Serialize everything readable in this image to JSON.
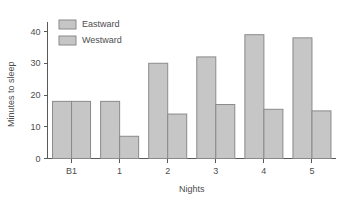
{
  "chart_data": {
    "type": "bar",
    "title": "",
    "subtitle": "",
    "xlabel": "Nights",
    "ylabel": "Minutes to sleep",
    "categories": [
      "B1",
      "1",
      "2",
      "3",
      "4",
      "5"
    ],
    "series": [
      {
        "name": "Eastward",
        "values": [
          18,
          18,
          30,
          32,
          39,
          38
        ],
        "color": "#c6c6c6"
      },
      {
        "name": "Westward",
        "values": [
          18,
          7,
          14,
          17,
          15.5,
          15
        ],
        "color": "#c6c6c6"
      }
    ],
    "ylim": [
      0,
      43
    ],
    "yticks": [
      0,
      10,
      20,
      30,
      40
    ],
    "ytick_labels": [
      "0",
      "10",
      "20",
      "30",
      "40"
    ],
    "grid": false,
    "legend_position": "top-left",
    "bar_edge_color": "#8a8a8a",
    "axis_color": "#595959",
    "text_color": "#4d4d4d",
    "background": "#ffffff"
  },
  "legend": {
    "entries": [
      {
        "label": "Eastward"
      },
      {
        "label": "Westward"
      }
    ]
  }
}
